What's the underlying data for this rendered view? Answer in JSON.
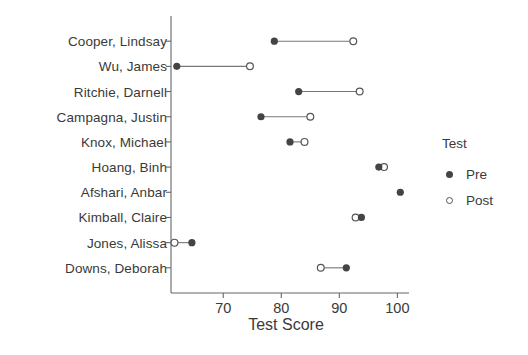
{
  "chart_data": {
    "type": "scatter",
    "subtype": "dumbbell",
    "title": "",
    "xlabel": "Test Score",
    "ylabel": "",
    "xlim": [
      61,
      102
    ],
    "xticks": [
      70,
      80,
      90,
      100
    ],
    "xtick_labels": [
      "70",
      "80",
      "90",
      "100"
    ],
    "grid": false,
    "legend": {
      "title": "Test",
      "position": "right",
      "entries": [
        {
          "label": "Pre",
          "marker": "filled-circle",
          "color": "#444444"
        },
        {
          "label": "Post",
          "marker": "open-circle",
          "color": "#555555"
        }
      ]
    },
    "categories": [
      "Cooper, Lindsay",
      "Wu, James",
      "Ritchie, Darnell",
      "Campagna, Justin",
      "Knox, Michael",
      "Hoang, Binh",
      "Afshari, Anbar",
      "Kimball, Claire",
      "Jones, Alissa",
      "Downs, Deborah"
    ],
    "series": [
      {
        "name": "Pre",
        "marker": "filled-circle",
        "values": [
          78.8,
          62.0,
          83.0,
          76.5,
          81.5,
          96.8,
          100.5,
          93.8,
          64.6,
          91.2
        ]
      },
      {
        "name": "Post",
        "marker": "open-circle",
        "values": [
          92.4,
          74.6,
          93.5,
          85.0,
          84.0,
          97.7,
          null,
          92.8,
          61.6,
          86.8
        ]
      }
    ]
  },
  "plot": {
    "axis_color": "#666666",
    "line_color": "#777777"
  }
}
